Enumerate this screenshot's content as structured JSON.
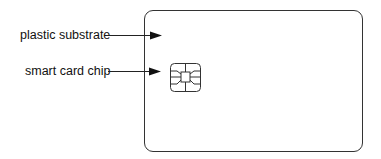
{
  "diagram": {
    "labels": [
      {
        "text": "plastic substrate",
        "x": 20,
        "y": 28
      },
      {
        "text": "smart card chip",
        "x": 25,
        "y": 64
      }
    ],
    "colors": {
      "stroke": "#222222",
      "background": "#ffffff"
    }
  }
}
